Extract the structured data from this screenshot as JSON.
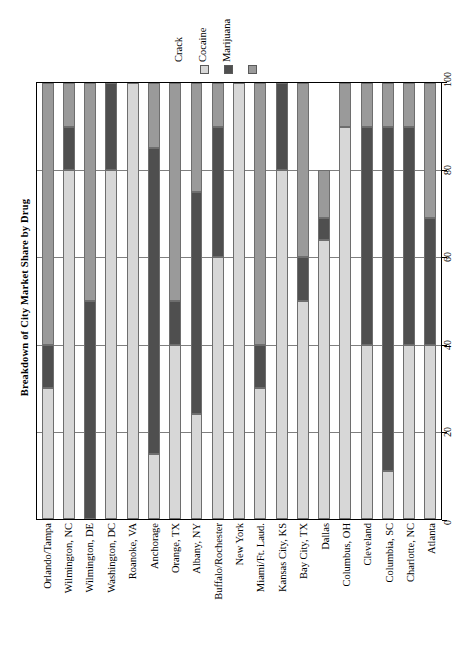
{
  "chart_data": {
    "type": "bar",
    "orientation": "horizontal-stacked",
    "title": "Breakdown of City Market Share by Drug",
    "xlabel": "",
    "ylabel": "",
    "stacked": true,
    "grid": true,
    "legend_position": "top-right",
    "axis": {
      "ticks": [
        0,
        20,
        40,
        60,
        80,
        100
      ],
      "tick_labels": [
        "0",
        "20",
        "40",
        "60",
        "80",
        "100"
      ],
      "lim": [
        0,
        100
      ]
    },
    "legend": [
      {
        "name": "Crack",
        "color": "#d7d7d7"
      },
      {
        "name": "Cocaine",
        "color": "#4f4f4f"
      },
      {
        "name": "Marijuana",
        "color": "#9a9a9a"
      }
    ],
    "categories": [
      "Orlando/Tampa",
      "Wilmington, NC",
      "Wilmington, DE",
      "Washington, DC",
      "Roanoke, VA",
      "Anchorage",
      "Orange, TX",
      "Albany, NY",
      "Buffalo/Rochester",
      "New York",
      "Miami/Ft. Laud.",
      "Kansas City, KS",
      "Bay City, TX",
      "Dallas",
      "Columbus, OH",
      "Cleveland",
      "Columbia, SC",
      "Charlotte, NC",
      "Atlanta"
    ],
    "series": [
      {
        "name": "Crack",
        "color": "#d7d7d7",
        "values": [
          30,
          80,
          0,
          80,
          100,
          15,
          40,
          24,
          60,
          100,
          30,
          80,
          50,
          64,
          90,
          40,
          11,
          40,
          40
        ]
      },
      {
        "name": "Cocaine",
        "color": "#4f4f4f",
        "values": [
          10,
          10,
          50,
          20,
          0,
          70,
          10,
          51,
          30,
          0,
          10,
          20,
          10,
          5,
          0,
          50,
          79,
          50,
          29
        ]
      },
      {
        "name": "Marijuana",
        "color": "#9a9a9a",
        "values": [
          60,
          10,
          50,
          0,
          0,
          15,
          50,
          25,
          10,
          0,
          60,
          0,
          40,
          11,
          10,
          10,
          10,
          10,
          31
        ]
      }
    ]
  }
}
